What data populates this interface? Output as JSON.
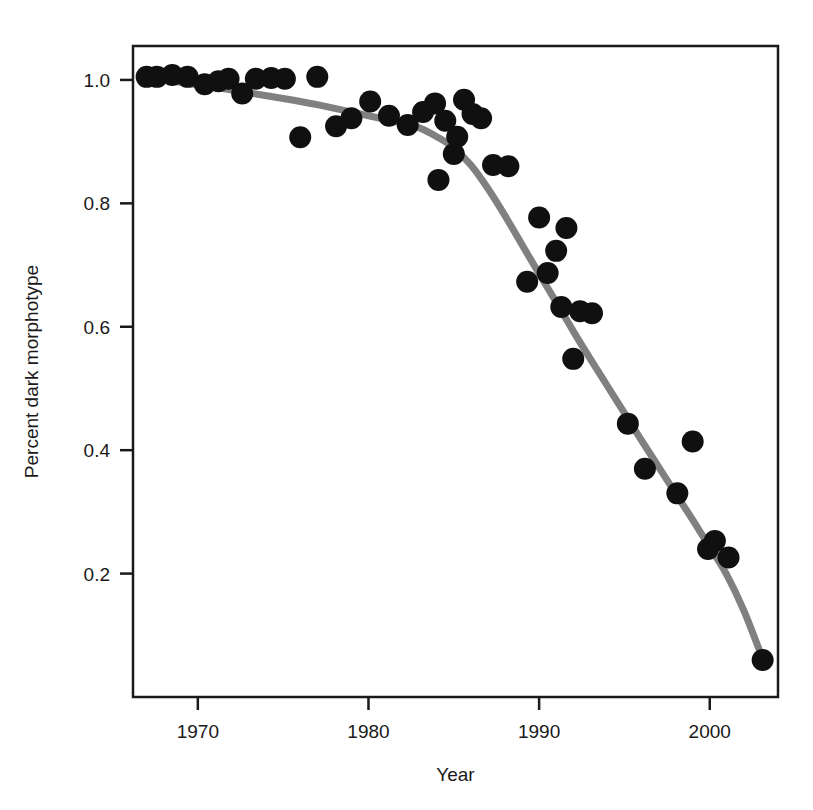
{
  "chart_data": {
    "type": "scatter",
    "title": "",
    "xlabel": "Year",
    "ylabel": "Percent dark morphotype",
    "xlim": [
      1966.2,
      2004.0
    ],
    "ylim": [
      0.0,
      1.055
    ],
    "xticks": [
      1970,
      1980,
      1990,
      2000
    ],
    "xtick_labels": [
      "1970",
      "1980",
      "1990",
      "2000"
    ],
    "yticks": [
      0.2,
      0.4,
      0.6,
      0.8,
      1.0
    ],
    "ytick_labels": [
      "0.2",
      "0.4",
      "0.6",
      "0.8",
      "1.0"
    ],
    "grid": false,
    "legend": "none",
    "frame": "box",
    "point_color": "#101010",
    "point_size": 11,
    "line_color": "#808080",
    "line_width": 7,
    "series": [
      {
        "name": "observed",
        "marker": "filled-circle",
        "x": [
          1967.0,
          1967.6,
          1968.5,
          1969.4,
          1970.4,
          1971.2,
          1971.8,
          1972.6,
          1973.4,
          1974.3,
          1975.1,
          1976.0,
          1977.0,
          1978.1,
          1979.0,
          1980.1,
          1981.2,
          1982.3,
          1983.2,
          1983.9,
          1984.1,
          1984.5,
          1985.0,
          1985.2,
          1985.6,
          1986.1,
          1986.6,
          1987.3,
          1988.2,
          1989.3,
          1990.0,
          1990.5,
          1991.0,
          1991.3,
          1991.6,
          1992.0,
          1992.4,
          1993.1,
          1995.2,
          1996.2,
          1998.1,
          1999.0,
          1999.9,
          2000.3,
          2001.1,
          2003.1
        ],
        "y": [
          1.005,
          1.005,
          1.008,
          1.005,
          0.993,
          0.998,
          1.002,
          0.978,
          1.002,
          1.003,
          1.002,
          0.907,
          1.005,
          0.925,
          0.938,
          0.965,
          0.942,
          0.927,
          0.948,
          0.962,
          0.838,
          0.934,
          0.88,
          0.908,
          0.968,
          0.945,
          0.938,
          0.862,
          0.86,
          0.673,
          0.777,
          0.687,
          0.723,
          0.632,
          0.76,
          0.548,
          0.625,
          0.622,
          0.443,
          0.37,
          0.33,
          0.414,
          0.24,
          0.253,
          0.226,
          0.06
        ]
      },
      {
        "name": "fitted-curve",
        "marker": "none",
        "x": [
          1967.0,
          1969.0,
          1971.0,
          1973.0,
          1975.0,
          1977.0,
          1979.0,
          1980.0,
          1981.0,
          1982.0,
          1983.0,
          1984.0,
          1985.0,
          1986.0,
          1987.0,
          1988.0,
          1989.0,
          1990.0,
          1991.0,
          1992.0,
          1993.0,
          1994.0,
          1995.0,
          1996.0,
          1997.0,
          1998.0,
          1999.0,
          2000.0,
          2001.0,
          2002.0,
          2003.1
        ],
        "y": [
          1.005,
          0.996,
          0.988,
          0.979,
          0.97,
          0.96,
          0.948,
          0.942,
          0.936,
          0.93,
          0.922,
          0.908,
          0.89,
          0.862,
          0.824,
          0.78,
          0.733,
          0.686,
          0.64,
          0.593,
          0.548,
          0.504,
          0.46,
          0.416,
          0.373,
          0.33,
          0.287,
          0.243,
          0.198,
          0.14,
          0.062
        ]
      }
    ]
  }
}
